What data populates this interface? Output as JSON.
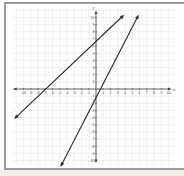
{
  "figure": {
    "panel_border_color": "#9b9b9b",
    "background": "#ffffff",
    "margin_color": "#f2efe8"
  },
  "chart_data": {
    "type": "line",
    "title": "",
    "xlabel": "x",
    "ylabel": "y",
    "xlim": [
      -11.5,
      11
    ],
    "ylim": [
      -10.7,
      11.3
    ],
    "grid": true,
    "grid_color": "#e8e8e8",
    "axis_color": "#3f3f3f",
    "line_color": "#2f2f2f",
    "tick_label_color": "#4a4a4a",
    "x_ticks": [
      -10,
      -9,
      -8,
      -7,
      -6,
      -5,
      -4,
      -3,
      -2,
      -1,
      1,
      2,
      3,
      4,
      5,
      6,
      7,
      8,
      9,
      10
    ],
    "y_ticks": [
      10,
      9,
      8,
      7,
      6,
      5,
      4,
      3,
      2,
      1,
      -1,
      -2,
      -3,
      -4,
      -5,
      -6,
      -7,
      -8,
      -9,
      -10
    ],
    "series": [
      {
        "name": "line-a",
        "description": "shallow rising line with arrows on both ends",
        "y_intercept": 7,
        "x_intercept": -8,
        "slope_estimate": 0.9,
        "endpoints": [
          [
            -11.3,
            -4.2
          ],
          [
            3.9,
            10.4
          ]
        ],
        "arrows": "both"
      },
      {
        "name": "line-b",
        "description": "steep rising line with arrows on both ends",
        "y_intercept": -1,
        "x_intercept": 0.5,
        "slope_estimate": 2,
        "endpoints": [
          [
            -4.9,
            -10.9
          ],
          [
            5.9,
            10.4
          ]
        ],
        "arrows": "both"
      }
    ]
  }
}
